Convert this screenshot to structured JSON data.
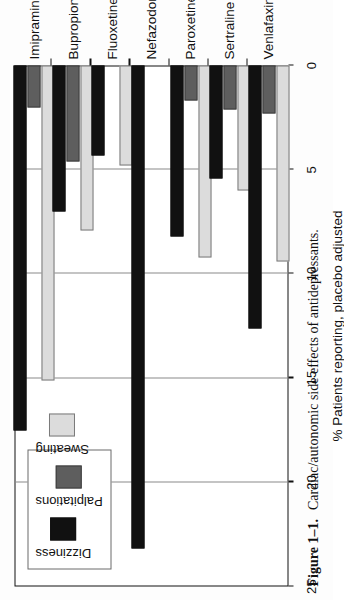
{
  "figure": {
    "number": "Figure 1–1.",
    "caption": "Cardiac/autonomic side effects of antidepressants."
  },
  "legend": {
    "entries": [
      {
        "label": "Dizziness",
        "color": "#111111"
      },
      {
        "label": "Palpitations",
        "color": "#5e5e5e"
      },
      {
        "label": "Sweating",
        "color": "#dcdcdc"
      }
    ]
  },
  "axis": {
    "ticks": [
      "25",
      "20",
      "15",
      "10",
      "5",
      "0"
    ],
    "title": "% Patients reporting, placebo adjusted"
  },
  "chart_data": {
    "type": "bar",
    "title": "Cardiac/autonomic side effects of antidepressants.",
    "orientation": "horizontal-rotated",
    "xlabel": "",
    "ylabel": "% Patients reporting, placebo adjusted",
    "ylim": [
      0,
      25
    ],
    "grid": true,
    "legend_position": "top-left",
    "categories": [
      "Imipramine",
      "Bupropion",
      "Fluoxetine",
      "Nefazodone",
      "Paroxetine",
      "Sertraline",
      "Venlafaxine"
    ],
    "series": [
      {
        "name": "Dizziness",
        "color": "#111111",
        "values": [
          17.5,
          7.0,
          4.3,
          23.2,
          8.2,
          5.4,
          12.6
        ]
      },
      {
        "name": "Palpitations",
        "color": "#5e5e5e",
        "values": [
          2.0,
          4.6,
          0,
          0,
          1.7,
          2.1,
          2.3
        ]
      },
      {
        "name": "Sweating",
        "color": "#dcdcdc",
        "values": [
          15.1,
          7.9,
          4.8,
          0,
          9.2,
          6.0,
          9.4
        ]
      }
    ]
  }
}
